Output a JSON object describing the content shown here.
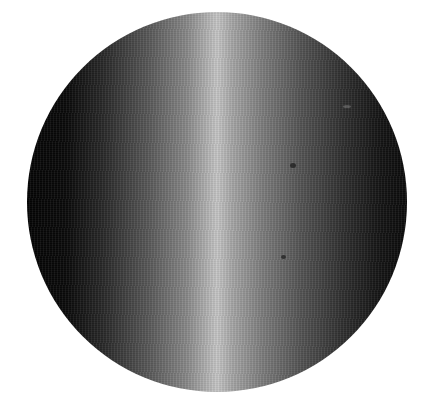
{
  "image": {
    "subject": "metallic sphere/disc with vertical cylindrical highlight",
    "colors": {
      "background": "#ffffff",
      "dark_edge": "#050505",
      "highlight": "#c8c8c8"
    }
  }
}
